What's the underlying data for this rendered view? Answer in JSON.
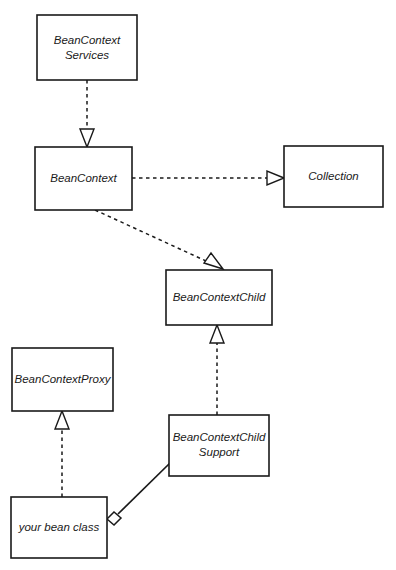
{
  "diagram": {
    "type": "uml-class-diagram",
    "background_color": "#ffffff",
    "line_color": "#1a1a1a",
    "nodes": [
      {
        "id": "beancontext-services",
        "label_line1": "BeanContext",
        "label_line2": "Services",
        "x": 37,
        "y": 15,
        "w": 100,
        "h": 65
      },
      {
        "id": "beancontext",
        "label_line1": "BeanContext",
        "label_line2": "",
        "x": 35,
        "y": 147,
        "w": 97,
        "h": 63
      },
      {
        "id": "collection",
        "label_line1": "Collection",
        "label_line2": "",
        "x": 284,
        "y": 146,
        "w": 99,
        "h": 61
      },
      {
        "id": "beancontextchild",
        "label_line1": "BeanContextChild",
        "label_line2": "",
        "x": 166,
        "y": 270,
        "w": 106,
        "h": 55
      },
      {
        "id": "beancontextproxy",
        "label_line1": "BeanContextProxy",
        "label_line2": "",
        "x": 12,
        "y": 348,
        "w": 101,
        "h": 63
      },
      {
        "id": "beancontextchild-support",
        "label_line1": "BeanContextChild",
        "label_line2": "Support",
        "x": 169,
        "y": 415,
        "w": 100,
        "h": 61
      },
      {
        "id": "your-bean-class",
        "label_line1": "your bean class",
        "label_line2": "",
        "x": 11,
        "y": 497,
        "w": 96,
        "h": 61
      }
    ],
    "edges": [
      {
        "id": "services-to-beancontext",
        "kind": "realization-dashed-hollow-arrow",
        "from": "beancontext-services",
        "to": "beancontext"
      },
      {
        "id": "beancontext-to-collection",
        "kind": "realization-dashed-hollow-arrow",
        "from": "beancontext",
        "to": "collection"
      },
      {
        "id": "beancontext-to-beancontextchild",
        "kind": "realization-dashed-hollow-arrow",
        "from": "beancontext",
        "to": "beancontextchild"
      },
      {
        "id": "support-to-beancontextchild",
        "kind": "realization-dashed-hollow-arrow",
        "from": "beancontextchild-support",
        "to": "beancontextchild"
      },
      {
        "id": "yourbean-to-proxy",
        "kind": "realization-dashed-hollow-arrow",
        "from": "your-bean-class",
        "to": "beancontextproxy"
      },
      {
        "id": "yourbean-aggregates-support",
        "kind": "aggregation-solid-hollow-diamond",
        "from": "your-bean-class",
        "to": "beancontextchild-support"
      }
    ]
  }
}
